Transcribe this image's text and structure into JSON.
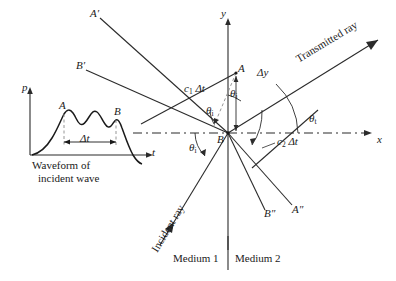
{
  "figure": {
    "type": "ray-refraction-diagram"
  },
  "inset": {
    "caption_line1": "Waveform of",
    "caption_line2": "incident wave",
    "y_axis_label": "p",
    "x_axis_label": "t",
    "peak_a_label": "A",
    "peak_b_label": "B",
    "interval_label": "Δt"
  },
  "axes": {
    "x_label": "x",
    "y_label": "y"
  },
  "points": {
    "a": "A",
    "b": "B",
    "a_prime": "A′",
    "b_prime": "B′",
    "a_dprime": "A″",
    "b_dprime": "B″"
  },
  "rays": {
    "incident": "Incident ray",
    "transmitted": "Transmitted ray"
  },
  "angles": {
    "theta_i_upper": "θ",
    "theta_i_upper_sub": "i",
    "theta_i_lower": "θ",
    "theta_i_lower_sub": "i",
    "theta_r": "θ",
    "theta_r_sub": "r",
    "theta_t": "θ",
    "theta_t_sub": "t"
  },
  "distances": {
    "c1": "c",
    "c1_sub": "1",
    "c1_dt": "Δt",
    "c2": "c",
    "c2_sub": "2",
    "c2_dt": "Δt",
    "delta_y": "Δy"
  },
  "media": {
    "medium1": "Medium 1",
    "medium2": "Medium 2"
  },
  "colors": {
    "line": "#2b2b2b",
    "dashed": "#3a3a3a",
    "background": "#ffffff"
  }
}
